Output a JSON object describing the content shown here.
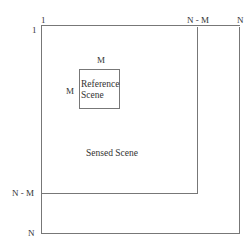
{
  "diagram": {
    "axis_labels": {
      "top_origin": "1",
      "left_origin": "1",
      "top_n_minus_m": "N - M",
      "top_n": "N",
      "left_n_minus_m": "N - M",
      "left_n": "N"
    },
    "reference": {
      "width_label": "M",
      "height_label": "M",
      "line1": "Reference",
      "line2": "Scene"
    },
    "sensed_label": "Sensed Scene"
  }
}
